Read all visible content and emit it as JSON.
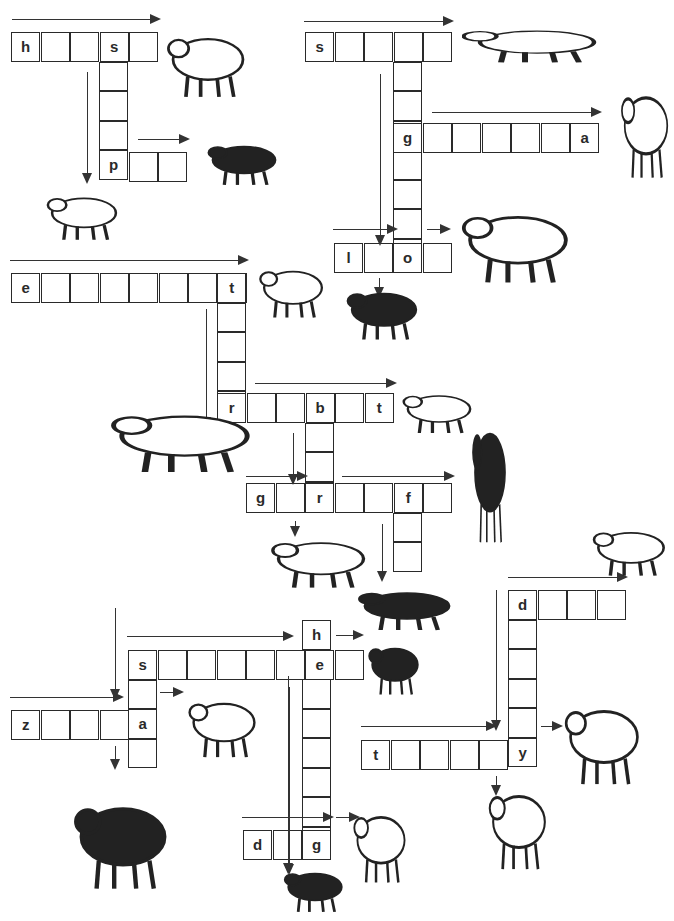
{
  "cell_size": 29.5,
  "words": [
    {
      "id": "horse",
      "dir": "across",
      "x": 11,
      "y": 32,
      "letters": [
        "h",
        "",
        "",
        "s",
        ""
      ]
    },
    {
      "id": "sheep",
      "dir": "down",
      "x": 99,
      "y": 32,
      "letters": [
        "s",
        "",
        "",
        "",
        ""
      ]
    },
    {
      "id": "pig",
      "dir": "across",
      "x": 99,
      "y": 152,
      "letters": [
        "p",
        "",
        ""
      ]
    },
    {
      "id": "snake",
      "dir": "across",
      "x": 305,
      "y": 32,
      "letters": [
        "s",
        "",
        "",
        "",
        ""
      ]
    },
    {
      "id": "kangaroo",
      "dir": "down",
      "x": 393,
      "y": 32,
      "letters": [
        "",
        "",
        "",
        "g",
        "",
        "",
        "",
        "o"
      ]
    },
    {
      "id": "gorilla",
      "dir": "across",
      "x": 393,
      "y": 123,
      "letters": [
        "g",
        "",
        "",
        "",
        "",
        "",
        "a"
      ]
    },
    {
      "id": "lion",
      "dir": "across",
      "x": 334,
      "y": 243,
      "letters": [
        "l",
        "",
        "o",
        ""
      ]
    },
    {
      "id": "elephant",
      "dir": "across",
      "x": 11,
      "y": 273,
      "letters": [
        "e",
        "",
        "",
        "",
        "",
        "",
        "",
        "t"
      ]
    },
    {
      "id": "tiger",
      "dir": "down",
      "x": 217,
      "y": 273,
      "letters": [
        "t",
        "",
        "",
        "",
        "r"
      ]
    },
    {
      "id": "rabbit",
      "dir": "across",
      "x": 217,
      "y": 393,
      "letters": [
        "r",
        "",
        "",
        "b",
        "",
        "t"
      ]
    },
    {
      "id": "bear",
      "dir": "down",
      "x": 305,
      "y": 393,
      "letters": [
        "b",
        "",
        "",
        "r"
      ]
    },
    {
      "id": "giraffe",
      "dir": "across",
      "x": 246,
      "y": 483,
      "letters": [
        "g",
        "",
        "r",
        "",
        "",
        "f",
        ""
      ]
    },
    {
      "id": "fox",
      "dir": "down",
      "x": 393,
      "y": 483,
      "letters": [
        "f",
        "",
        ""
      ]
    },
    {
      "id": "hedgehog",
      "dir": "down",
      "x": 302,
      "y": 620,
      "letters": [
        "h",
        "e",
        "",
        "",
        "",
        "",
        "",
        "g"
      ]
    },
    {
      "id": "squirrel",
      "dir": "across",
      "x": 128,
      "y": 650,
      "letters": [
        "s",
        "",
        "",
        "",
        "",
        "",
        "e",
        ""
      ]
    },
    {
      "id": "stag",
      "dir": "down",
      "x": 128,
      "y": 650,
      "letters": [
        "s",
        "",
        "a",
        ""
      ]
    },
    {
      "id": "zebra",
      "dir": "across",
      "x": 11,
      "y": 710,
      "letters": [
        "z",
        "",
        "",
        "",
        "a"
      ]
    },
    {
      "id": "dog",
      "dir": "across",
      "x": 243,
      "y": 830,
      "letters": [
        "d",
        "",
        "g"
      ]
    },
    {
      "id": "duck",
      "dir": "across",
      "x": 508,
      "y": 590,
      "letters": [
        "d",
        "",
        "",
        ""
      ]
    },
    {
      "id": "donkey",
      "dir": "down",
      "x": 508,
      "y": 590,
      "letters": [
        "d",
        "",
        "",
        "",
        "",
        "y"
      ]
    },
    {
      "id": "turkey",
      "dir": "across",
      "x": 361,
      "y": 740,
      "letters": [
        "t",
        "",
        "",
        "",
        "",
        "y"
      ]
    }
  ],
  "animals": [
    {
      "name": "horse",
      "x": 162,
      "y": 22,
      "w": 92,
      "h": 78
    },
    {
      "name": "pig",
      "x": 203,
      "y": 135,
      "w": 82,
      "h": 52
    },
    {
      "name": "sheep",
      "x": 42,
      "y": 186,
      "w": 84,
      "h": 56
    },
    {
      "name": "snake",
      "x": 462,
      "y": 22,
      "w": 150,
      "h": 42
    },
    {
      "name": "gorilla",
      "x": 618,
      "y": 74,
      "w": 56,
      "h": 108
    },
    {
      "name": "lion",
      "x": 455,
      "y": 198,
      "w": 126,
      "h": 88
    },
    {
      "name": "kangaroo",
      "x": 342,
      "y": 280,
      "w": 84,
      "h": 62
    },
    {
      "name": "elephant",
      "x": 255,
      "y": 258,
      "w": 76,
      "h": 62
    },
    {
      "name": "rabbit",
      "x": 398,
      "y": 385,
      "w": 82,
      "h": 50
    },
    {
      "name": "tiger",
      "x": 102,
      "y": 400,
      "w": 165,
      "h": 75
    },
    {
      "name": "giraffe",
      "x": 470,
      "y": 403,
      "w": 40,
      "h": 145
    },
    {
      "name": "polar-bear",
      "x": 265,
      "y": 530,
      "w": 112,
      "h": 60
    },
    {
      "name": "duck",
      "x": 588,
      "y": 520,
      "w": 86,
      "h": 58
    },
    {
      "name": "fox",
      "x": 352,
      "y": 582,
      "w": 110,
      "h": 50
    },
    {
      "name": "squirrel",
      "x": 365,
      "y": 635,
      "w": 60,
      "h": 62
    },
    {
      "name": "zebra",
      "x": 184,
      "y": 688,
      "w": 80,
      "h": 72
    },
    {
      "name": "turkey",
      "x": 560,
      "y": 690,
      "w": 88,
      "h": 98
    },
    {
      "name": "deer",
      "x": 68,
      "y": 785,
      "w": 110,
      "h": 108
    },
    {
      "name": "dog",
      "x": 350,
      "y": 798,
      "w": 62,
      "h": 88
    },
    {
      "name": "hedgehog",
      "x": 280,
      "y": 862,
      "w": 70,
      "h": 52
    },
    {
      "name": "donkey",
      "x": 485,
      "y": 775,
      "w": 68,
      "h": 98
    }
  ],
  "arrows_h": [
    {
      "x": 12,
      "y": 19,
      "w": 147
    },
    {
      "x": 138,
      "y": 139,
      "w": 50
    },
    {
      "x": 304,
      "y": 21,
      "w": 148
    },
    {
      "x": 432,
      "y": 112,
      "w": 168
    },
    {
      "x": 333,
      "y": 229,
      "w": 63
    },
    {
      "x": 427,
      "y": 229,
      "w": 22
    },
    {
      "x": 10,
      "y": 260,
      "w": 237
    },
    {
      "x": 255,
      "y": 383,
      "w": 140
    },
    {
      "x": 246,
      "y": 476,
      "w": 60
    },
    {
      "x": 342,
      "y": 476,
      "w": 111
    },
    {
      "x": 508,
      "y": 577,
      "w": 118
    },
    {
      "x": 127,
      "y": 636,
      "w": 165
    },
    {
      "x": 336,
      "y": 635,
      "w": 26
    },
    {
      "x": 10,
      "y": 697,
      "w": 112
    },
    {
      "x": 160,
      "y": 692,
      "w": 22
    },
    {
      "x": 361,
      "y": 726,
      "w": 134
    },
    {
      "x": 541,
      "y": 726,
      "w": 20
    },
    {
      "x": 242,
      "y": 817,
      "w": 90
    },
    {
      "x": 336,
      "y": 817,
      "w": 22
    }
  ],
  "arrows_v": [
    {
      "x": 87,
      "y": 72,
      "h": 110
    },
    {
      "x": 380,
      "y": 74,
      "h": 170
    },
    {
      "x": 379,
      "y": 278,
      "h": 18
    },
    {
      "x": 206,
      "y": 309,
      "h": 117
    },
    {
      "x": 293,
      "y": 433,
      "h": 50
    },
    {
      "x": 295,
      "y": 521,
      "h": 14
    },
    {
      "x": 382,
      "y": 524,
      "h": 56
    },
    {
      "x": 115,
      "y": 608,
      "h": 90
    },
    {
      "x": 115,
      "y": 746,
      "h": 22
    },
    {
      "x": 289,
      "y": 687,
      "h": 186
    },
    {
      "x": 496,
      "y": 590,
      "h": 139
    },
    {
      "x": 496,
      "y": 776,
      "h": 18
    },
    {
      "x": 288,
      "y": 676,
      "h": 196
    }
  ]
}
